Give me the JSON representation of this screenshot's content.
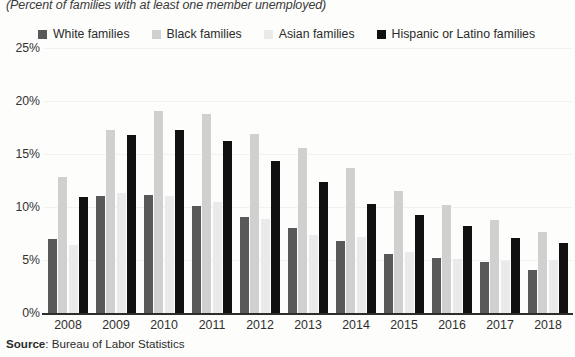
{
  "subtitle": "(Percent of families with at least one member unemployed)",
  "source_label": "Source",
  "source_text": ": Bureau of Labor Statistics",
  "legend": [
    {
      "label": "White families",
      "color": "#595959"
    },
    {
      "label": "Black families",
      "color": "#d0d0d0"
    },
    {
      "label": "Asian families",
      "color": "#eaeaea"
    },
    {
      "label": "Hispanic or Latino families",
      "color": "#111111"
    }
  ],
  "yticks": [
    "25%",
    "20%",
    "15%",
    "10%",
    "5%",
    "0%"
  ],
  "chart_data": {
    "type": "bar",
    "title": "",
    "subtitle": "(Percent of families with at least one member unemployed)",
    "xlabel": "",
    "ylabel": "",
    "ylim": [
      0,
      25
    ],
    "ytick_values": [
      0,
      5,
      10,
      15,
      20,
      25
    ],
    "grid": true,
    "legend_position": "top",
    "categories": [
      "2008",
      "2009",
      "2010",
      "2011",
      "2012",
      "2013",
      "2014",
      "2015",
      "2016",
      "2017",
      "2018"
    ],
    "series": [
      {
        "name": "White families",
        "color": "#595959",
        "values": [
          7.0,
          11.0,
          11.1,
          10.1,
          9.1,
          8.0,
          6.8,
          5.6,
          5.2,
          4.8,
          4.1
        ]
      },
      {
        "name": "Black families",
        "color": "#d0d0d0",
        "values": [
          12.8,
          17.3,
          19.1,
          18.8,
          16.9,
          15.6,
          13.7,
          11.5,
          10.2,
          8.8,
          7.6
        ]
      },
      {
        "name": "Asian families",
        "color": "#eaeaea",
        "values": [
          6.4,
          11.3,
          11.0,
          10.5,
          8.9,
          7.4,
          7.2,
          5.8,
          5.1,
          4.9,
          5.0
        ]
      },
      {
        "name": "Hispanic or Latino families",
        "color": "#111111",
        "values": [
          10.9,
          16.8,
          17.3,
          16.2,
          14.3,
          12.4,
          10.3,
          9.2,
          8.2,
          7.1,
          6.6
        ]
      }
    ],
    "source": "Source: Bureau of Labor Statistics"
  }
}
